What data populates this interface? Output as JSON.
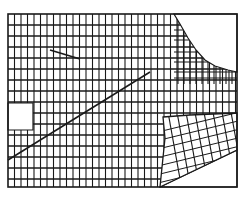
{
  "diagram": {
    "type": "mesh-grid",
    "stroke_color": "#1a1a1a",
    "background_color": "#ffffff",
    "frame": {
      "x1": 8,
      "y1": 14,
      "x2": 237,
      "y2": 187
    },
    "base_grid": {
      "col_spacing": 6.5,
      "row_spacing": 11
    },
    "blank_regions": [
      {
        "name": "top-right-void",
        "points": [
          [
            174,
            14
          ],
          [
            237,
            14
          ],
          [
            237,
            72
          ],
          [
            228,
            70
          ],
          [
            215,
            66
          ],
          [
            205,
            60
          ],
          [
            196,
            50
          ],
          [
            188,
            38
          ],
          [
            180,
            24
          ]
        ]
      },
      {
        "name": "left-notch-void",
        "points": [
          [
            8,
            103
          ],
          [
            33,
            103
          ],
          [
            33,
            130
          ],
          [
            8,
            130
          ]
        ]
      },
      {
        "name": "bottom-right-void",
        "points": [
          [
            160,
            187
          ],
          [
            237,
            150
          ],
          [
            237,
            187
          ]
        ]
      }
    ],
    "dense_region": {
      "name": "curved-refinement-zone",
      "boundary": [
        [
          174,
          14
        ],
        [
          180,
          24
        ],
        [
          188,
          38
        ],
        [
          196,
          50
        ],
        [
          205,
          60
        ],
        [
          215,
          66
        ],
        [
          228,
          70
        ],
        [
          237,
          72
        ],
        [
          237,
          84
        ],
        [
          174,
          84
        ]
      ],
      "extra_cols": [
        178,
        184,
        190,
        196,
        202,
        208,
        214,
        220,
        226,
        232
      ],
      "extra_rows": [
        30,
        40,
        52,
        62,
        72,
        78
      ]
    },
    "skewed_region": {
      "name": "oblique-mesh-zone",
      "boundary": [
        [
          163,
          117
        ],
        [
          190,
          115
        ],
        [
          237,
          113
        ],
        [
          237,
          150
        ],
        [
          160,
          187
        ],
        [
          165,
          138
        ]
      ],
      "u_lines": 8,
      "v_lines": 9
    },
    "strokes": [
      {
        "name": "short-diagonal-stroke",
        "x1": 50,
        "y1": 50,
        "x2": 80,
        "y2": 59
      },
      {
        "name": "long-diagonal-stroke",
        "x1": 8,
        "y1": 160,
        "x2": 150,
        "y2": 72
      }
    ]
  }
}
